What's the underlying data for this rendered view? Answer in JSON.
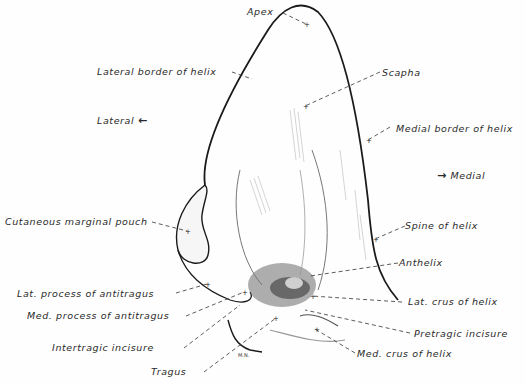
{
  "figure": {
    "type": "anatomical line drawing",
    "artist_signature": "M.N.",
    "ink_color": "#1a1a1a",
    "background": "#fefefe"
  },
  "orientation": {
    "lateral": {
      "label": "Lateral",
      "arrow": "←"
    },
    "medial": {
      "label": "Medial",
      "arrow": "→"
    }
  },
  "labels": [
    {
      "id": "apex",
      "text": "Apex"
    },
    {
      "id": "lateral-border-of-helix",
      "text": "Lateral border of helix"
    },
    {
      "id": "scapha",
      "text": "Scapha"
    },
    {
      "id": "medial-border-of-helix",
      "text": "Medial border of helix"
    },
    {
      "id": "cutaneous-marginal-pouch",
      "text": "Cutaneous marginal pouch"
    },
    {
      "id": "spine-of-helix",
      "text": "Spine of helix"
    },
    {
      "id": "anthelix",
      "text": "Anthelix"
    },
    {
      "id": "lat-process-of-antitragus",
      "text": "Lat. process of antitragus"
    },
    {
      "id": "lat-crus-of-helix",
      "text": "Lat. crus of helix"
    },
    {
      "id": "med-process-of-antitragus",
      "text": "Med. process of antitragus"
    },
    {
      "id": "pretragic-incisure",
      "text": "Pretragic incisure"
    },
    {
      "id": "intertragic-incisure",
      "text": "Intertragic incisure"
    },
    {
      "id": "med-crus-of-helix",
      "text": "Med. crus of helix"
    },
    {
      "id": "tragus",
      "text": "Tragus"
    }
  ]
}
